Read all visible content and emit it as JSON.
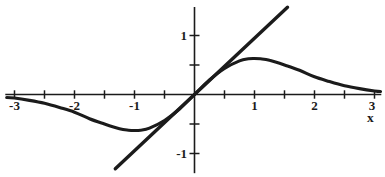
{
  "figure": {
    "background": "#ffffff",
    "ink_color": "#1b1b1b"
  },
  "chart_data": {
    "type": "line",
    "title": "",
    "xlabel": "x",
    "ylabel": "",
    "grid": false,
    "legend": null,
    "x_range": [
      -3.14,
      3.1
    ],
    "y_range": [
      -1.32,
      1.47
    ],
    "x_axis": {
      "ticks": [
        -3,
        -2.5,
        -2,
        -1.5,
        -1,
        -0.5,
        0.5,
        1,
        1.5,
        2,
        2.5,
        3
      ],
      "labeled_ticks": [
        -3,
        -2,
        -1,
        1,
        2,
        3
      ]
    },
    "y_axis": {
      "ticks": [
        -1,
        -0.5,
        0.5,
        1
      ],
      "labeled_ticks": [
        -1,
        1
      ]
    },
    "series": [
      {
        "name": "bell-shaped odd curve (y = x·e^(-x²/2))",
        "style": "smooth-curve",
        "points": [
          [
            -3.13,
            -0.05
          ],
          [
            -3,
            -0.06
          ],
          [
            -2.75,
            -0.1
          ],
          [
            -2.5,
            -0.15
          ],
          [
            -2.25,
            -0.22
          ],
          [
            -2,
            -0.3
          ],
          [
            -1.75,
            -0.41
          ],
          [
            -1.5,
            -0.5
          ],
          [
            -1.25,
            -0.58
          ],
          [
            -1.1,
            -0.605
          ],
          [
            -1,
            -0.61
          ],
          [
            -0.9,
            -0.605
          ],
          [
            -0.75,
            -0.57
          ],
          [
            -0.5,
            -0.44
          ],
          [
            -0.25,
            -0.245
          ],
          [
            0,
            0
          ],
          [
            0.25,
            0.245
          ],
          [
            0.5,
            0.44
          ],
          [
            0.75,
            0.57
          ],
          [
            0.9,
            0.605
          ],
          [
            1,
            0.61
          ],
          [
            1.1,
            0.605
          ],
          [
            1.25,
            0.58
          ],
          [
            1.5,
            0.5
          ],
          [
            1.75,
            0.41
          ],
          [
            2,
            0.3
          ],
          [
            2.25,
            0.22
          ],
          [
            2.5,
            0.15
          ],
          [
            2.75,
            0.1
          ],
          [
            3,
            0.06
          ],
          [
            3.1,
            0.05
          ]
        ]
      },
      {
        "name": "tangent line at origin (y = x)",
        "style": "straight-line",
        "points": [
          [
            -1.32,
            -1.26
          ],
          [
            1.55,
            1.48
          ]
        ]
      }
    ]
  }
}
